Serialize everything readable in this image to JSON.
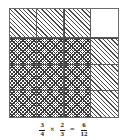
{
  "figure": {
    "type": "fraction-multiplication-area-model",
    "grid": {
      "columns": 4,
      "rows": 4,
      "cells": [
        {
          "fill": "diagonal"
        },
        {
          "fill": "diagonal"
        },
        {
          "fill": "diagonal"
        },
        {
          "fill": "empty"
        },
        {
          "fill": "cross"
        },
        {
          "fill": "cross"
        },
        {
          "fill": "cross"
        },
        {
          "fill": "diagonal"
        },
        {
          "fill": "cross"
        },
        {
          "fill": "cross"
        },
        {
          "fill": "cross"
        },
        {
          "fill": "diagonal"
        },
        {
          "fill": "cross"
        },
        {
          "fill": "cross"
        },
        {
          "fill": "cross"
        },
        {
          "fill": "diagonal"
        }
      ]
    },
    "colors": {
      "border": "#6b6b6b",
      "gridline": "#5a5a5a",
      "hatch": "#4a4a4a",
      "crosshatch": "#3a3a3a",
      "background": "#ffffff",
      "text": "#1a1a1a"
    }
  },
  "equation": {
    "factor_a": {
      "numerator": "3",
      "denominator": "4"
    },
    "times_symbol": "×",
    "factor_b": {
      "numerator": "2",
      "denominator": "3"
    },
    "equals_symbol": "=",
    "product": {
      "numerator": "6",
      "denominator": "12"
    }
  },
  "chart_data": {
    "type": "area-model",
    "title": "",
    "xlabel": "",
    "ylabel": "",
    "categories": [
      "col1",
      "col2",
      "col3",
      "col4"
    ],
    "series": [
      {
        "name": "row1",
        "values": [
          "diagonal",
          "diagonal",
          "diagonal",
          "empty"
        ]
      },
      {
        "name": "row2",
        "values": [
          "cross",
          "cross",
          "cross",
          "diagonal"
        ]
      },
      {
        "name": "row3",
        "values": [
          "cross",
          "cross",
          "cross",
          "diagonal"
        ]
      },
      {
        "name": "row4",
        "values": [
          "cross",
          "cross",
          "cross",
          "diagonal"
        ]
      }
    ],
    "annotations": [
      "3/4 × 2/3 = 6/12"
    ]
  }
}
